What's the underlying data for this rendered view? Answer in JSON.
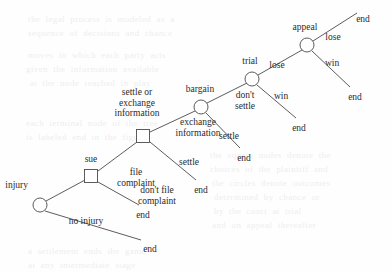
{
  "figure": {
    "type": "extensive-form-game-tree",
    "orientation": "left-to-right-ascending",
    "background_color": "#fefefe",
    "line_color": "#4a4a4a",
    "text_color": "#2b2b2b"
  },
  "legend": {
    "circle_meaning": "chance / nature node",
    "square_meaning": "decision node"
  },
  "nodes": [
    {
      "id": "injury",
      "label": "injury",
      "shape": "circle",
      "x": 40,
      "y": 205,
      "r": 7,
      "label_x": 28,
      "label_y": 180,
      "label_align": "rgt"
    },
    {
      "id": "sue",
      "label": "sue",
      "shape": "square",
      "x": 91,
      "y": 176,
      "size": 13,
      "label_x": 91,
      "label_y": 154,
      "label_align": "ctr"
    },
    {
      "id": "settle_or_exchange",
      "label": "settle or\nexchange\ninformation",
      "shape": "square",
      "x": 143,
      "y": 136,
      "size": 13,
      "label_x": 137,
      "label_y": 87,
      "label_align": "ctr"
    },
    {
      "id": "bargain",
      "label": "bargain",
      "shape": "circle",
      "x": 201,
      "y": 107,
      "r": 7,
      "label_x": 200,
      "label_y": 84,
      "label_align": "ctr"
    },
    {
      "id": "trial",
      "label": "trial",
      "shape": "circle",
      "x": 252,
      "y": 79,
      "r": 7,
      "label_x": 250,
      "label_y": 56,
      "label_align": "ctr"
    },
    {
      "id": "appeal",
      "label": "appeal",
      "shape": "circle",
      "x": 307,
      "y": 45,
      "r": 7,
      "label_x": 305,
      "label_y": 22,
      "label_align": "ctr"
    }
  ],
  "leaves": [
    {
      "id": "end_no_injury",
      "label": "end",
      "x": 150,
      "y": 244
    },
    {
      "id": "end_dont_file",
      "label": "end",
      "x": 143,
      "y": 210
    },
    {
      "id": "end_settle_1",
      "label": "end",
      "x": 201,
      "y": 185
    },
    {
      "id": "end_settle_2",
      "label": "end",
      "x": 244,
      "y": 153
    },
    {
      "id": "end_trial_win",
      "label": "end",
      "x": 299,
      "y": 123
    },
    {
      "id": "end_appeal_lose",
      "label": "end",
      "x": 363,
      "y": 14
    },
    {
      "id": "end_appeal_win",
      "label": "end",
      "x": 355,
      "y": 92
    }
  ],
  "edges": [
    {
      "id": "injury-to-sue",
      "from": "injury",
      "to": "sue",
      "label": "",
      "x1": 46,
      "y1": 201,
      "x2": 85,
      "y2": 180
    },
    {
      "id": "injury-to-end",
      "from": "injury",
      "to": "end_no_injury",
      "label": "no injury",
      "x1": 45,
      "y1": 211,
      "x2": 141,
      "y2": 240,
      "label_x": 86,
      "label_y": 216,
      "label_align": "ctr"
    },
    {
      "id": "sue-file-complaint",
      "from": "sue",
      "to": "settle_or_exchange",
      "label": "file\ncomplaint",
      "x1": 98,
      "y1": 171,
      "x2": 137,
      "y2": 142,
      "label_x": 136,
      "label_y": 167,
      "label_align": "ctr"
    },
    {
      "id": "sue-dont-file",
      "from": "sue",
      "to": "end_dont_file",
      "label": "don't file\ncomplaint",
      "x1": 98,
      "y1": 182,
      "x2": 139,
      "y2": 205,
      "label_x": 157,
      "label_y": 185,
      "label_align": "ctr"
    },
    {
      "id": "soe-exchange-info",
      "from": "settle_or_exchange",
      "to": "bargain",
      "label": "exchange\ninformation",
      "x1": 150,
      "y1": 132,
      "x2": 195,
      "y2": 111,
      "label_x": 198,
      "label_y": 117,
      "label_align": "ctr"
    },
    {
      "id": "soe-settle",
      "from": "settle_or_exchange",
      "to": "end_settle_1",
      "label": "settle",
      "x1": 150,
      "y1": 142,
      "x2": 196,
      "y2": 180,
      "label_x": 189,
      "label_y": 157,
      "label_align": "ctr"
    },
    {
      "id": "bargain-dont-settle",
      "from": "bargain",
      "to": "trial",
      "label": "don't\nsettle",
      "x1": 207,
      "y1": 103,
      "x2": 247,
      "y2": 83,
      "label_x": 245,
      "label_y": 90,
      "label_align": "ctr"
    },
    {
      "id": "bargain-settle",
      "from": "bargain",
      "to": "end_settle_2",
      "label": "settle",
      "x1": 206,
      "y1": 113,
      "x2": 240,
      "y2": 148,
      "label_x": 229,
      "label_y": 131,
      "label_align": "ctr"
    },
    {
      "id": "trial-lose",
      "from": "trial",
      "to": "appeal",
      "label": "lose",
      "x1": 258,
      "y1": 75,
      "x2": 302,
      "y2": 50,
      "label_x": 277,
      "label_y": 60,
      "label_align": "ctr"
    },
    {
      "id": "trial-win",
      "from": "trial",
      "to": "end_trial_win",
      "label": "win",
      "x1": 257,
      "y1": 85,
      "x2": 296,
      "y2": 118,
      "label_x": 281,
      "label_y": 91,
      "label_align": "ctr"
    },
    {
      "id": "appeal-lose",
      "from": "appeal",
      "to": "end_appeal_lose",
      "label": "lose",
      "x1": 313,
      "y1": 41,
      "x2": 357,
      "y2": 13,
      "label_x": 333,
      "label_y": 32,
      "label_align": "ctr"
    },
    {
      "id": "appeal-win",
      "from": "appeal",
      "to": "end_appeal_win",
      "label": "win",
      "x1": 312,
      "y1": 51,
      "x2": 350,
      "y2": 87,
      "label_x": 332,
      "label_y": 58,
      "label_align": "ctr"
    }
  ],
  "bleed_text": [
    {
      "text": "the  legal  process  is  modeled  as  a",
      "x": 28,
      "y": 14
    },
    {
      "text": "sequence  of  decisions  and  chance",
      "x": 28,
      "y": 28
    },
    {
      "text": "moves  in  which  each  party  acts",
      "x": 28,
      "y": 50
    },
    {
      "text": "given  the  information  available",
      "x": 26,
      "y": 64
    },
    {
      "text": "at  the  node  reached  in  play",
      "x": 30,
      "y": 78
    },
    {
      "text": "each  terminal  node  of  the  tree",
      "x": 26,
      "y": 118
    },
    {
      "text": "is  labeled  end  in  the  figure",
      "x": 26,
      "y": 132
    },
    {
      "text": "the  square  nodes  denote  the",
      "x": 210,
      "y": 150
    },
    {
      "text": "choices  of  the  plaintiff  and",
      "x": 210,
      "y": 164
    },
    {
      "text": "the  circles  denote  outcomes",
      "x": 212,
      "y": 178
    },
    {
      "text": "determined  by  chance  or",
      "x": 214,
      "y": 192
    },
    {
      "text": "by  the  court  at  trial",
      "x": 214,
      "y": 206
    },
    {
      "text": "and  on  appeal  thereafter",
      "x": 212,
      "y": 220
    },
    {
      "text": "a  settlement  ends  the  game",
      "x": 28,
      "y": 246
    },
    {
      "text": "at  any  intermediate  stage",
      "x": 28,
      "y": 260
    }
  ]
}
